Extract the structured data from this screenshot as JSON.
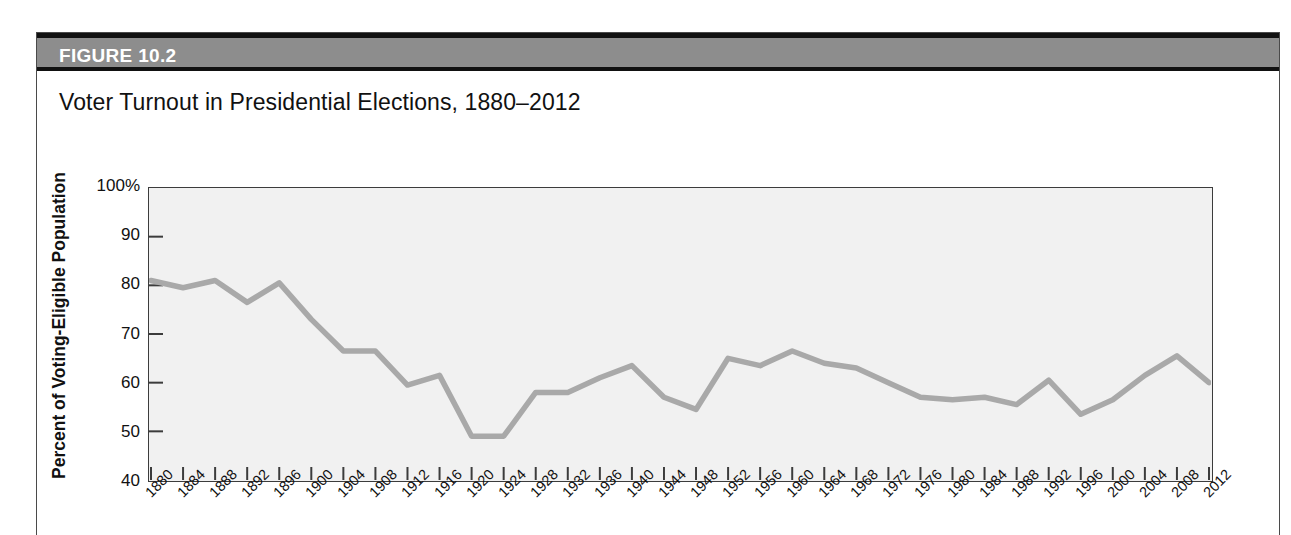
{
  "figure": {
    "header_label": "FIGURE 10.2",
    "title": "Voter Turnout in Presidential Elections, 1880–2012"
  },
  "colors": {
    "header_bar": "#8d8d8d",
    "header_edge": "#111111",
    "plot_background": "#f1f1f1",
    "line": "#a9a9a9",
    "axis": "#3c3c3c",
    "text": "#111111"
  },
  "chart_data": {
    "type": "line",
    "title": "Voter Turnout in Presidential Elections, 1880–2012",
    "xlabel": "",
    "ylabel": "Percent of Voting-Eligible Population",
    "ylim": [
      40,
      100
    ],
    "ytick_labels": [
      "100%",
      "90",
      "80",
      "70",
      "60",
      "50",
      "40"
    ],
    "yticks": [
      100,
      90,
      80,
      70,
      60,
      50,
      40
    ],
    "grid": false,
    "legend": "none",
    "x": [
      1880,
      1884,
      1888,
      1892,
      1896,
      1900,
      1904,
      1908,
      1912,
      1916,
      1920,
      1924,
      1928,
      1932,
      1936,
      1940,
      1944,
      1948,
      1952,
      1956,
      1960,
      1964,
      1968,
      1972,
      1976,
      1980,
      1984,
      1988,
      1992,
      1996,
      2000,
      2004,
      2008,
      2012
    ],
    "categories": [
      "1880",
      "1884",
      "1888",
      "1892",
      "1896",
      "1900",
      "1904",
      "1908",
      "1912",
      "1916",
      "1920",
      "1924",
      "1928",
      "1932",
      "1936",
      "1940",
      "1944",
      "1948",
      "1952",
      "1956",
      "1960",
      "1964",
      "1968",
      "1972",
      "1976",
      "1980",
      "1984",
      "1988",
      "1992",
      "1996",
      "2000",
      "2004",
      "2008",
      "2012"
    ],
    "values": [
      81.0,
      79.5,
      81.0,
      76.5,
      80.5,
      73.0,
      66.5,
      66.5,
      59.5,
      61.5,
      49.0,
      49.0,
      58.0,
      58.0,
      61.0,
      63.5,
      57.0,
      54.5,
      65.0,
      63.5,
      66.5,
      64.0,
      63.0,
      60.0,
      57.0,
      56.5,
      57.0,
      55.5,
      60.5,
      53.5,
      56.5,
      61.5,
      65.5,
      60.0
    ],
    "series": [
      {
        "name": "Voter turnout",
        "values": [
          81.0,
          79.5,
          81.0,
          76.5,
          80.5,
          73.0,
          66.5,
          66.5,
          59.5,
          61.5,
          49.0,
          49.0,
          58.0,
          58.0,
          61.0,
          63.5,
          57.0,
          54.5,
          65.0,
          63.5,
          66.5,
          64.0,
          63.0,
          60.0,
          57.0,
          56.5,
          57.0,
          55.5,
          60.5,
          53.5,
          56.5,
          61.5,
          65.5,
          60.0
        ]
      }
    ]
  }
}
